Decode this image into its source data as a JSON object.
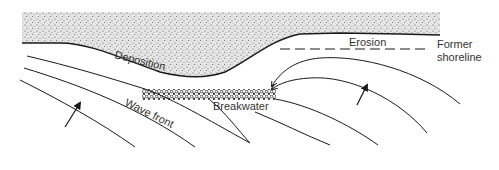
{
  "diagram": {
    "labels": {
      "deposition": "Deposition",
      "erosion": "Erosion",
      "former_shoreline_line1": "Former",
      "former_shoreline_line2": "shoreline",
      "breakwater": "Breakwater",
      "wave_front": "Wave front"
    },
    "elements": [
      {
        "id": "beach",
        "type": "sand-area"
      },
      {
        "id": "shoreline",
        "type": "curve"
      },
      {
        "id": "former-shoreline",
        "type": "dashed-line"
      },
      {
        "id": "breakwater",
        "type": "rubble-bar"
      },
      {
        "id": "wave-fronts",
        "type": "curves",
        "count": 6
      },
      {
        "id": "wave-direction-arrows",
        "type": "arrows",
        "count": 2
      },
      {
        "id": "diffraction-arrows",
        "type": "arrows",
        "count": 2
      }
    ],
    "colors": {
      "stroke": "#1a1a1a",
      "sand": "#bdbdbd",
      "text": "#333333",
      "background": "#ffffff"
    }
  }
}
